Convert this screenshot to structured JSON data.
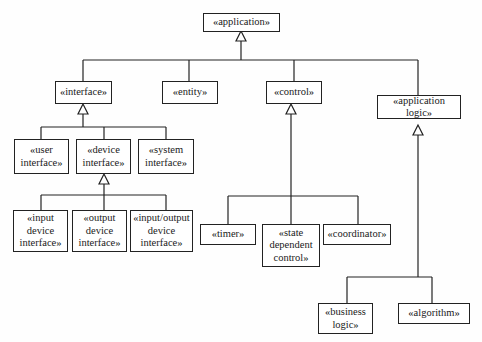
{
  "diagram": {
    "type": "UML stereotype generalization hierarchy",
    "root": {
      "id": "application",
      "label": "«application»"
    },
    "nodes": [
      {
        "id": "application",
        "label": "«application»",
        "parent": null
      },
      {
        "id": "interface",
        "label": "«interface»",
        "parent": "application"
      },
      {
        "id": "entity",
        "label": "«entity»",
        "parent": "application"
      },
      {
        "id": "control",
        "label": "«control»",
        "parent": "application"
      },
      {
        "id": "application_logic",
        "label": "«application logic»",
        "parent": "application"
      },
      {
        "id": "user_interface",
        "label": "«user\ninterface»",
        "parent": "interface"
      },
      {
        "id": "device_interface",
        "label": "«device\ninterface»",
        "parent": "interface"
      },
      {
        "id": "system_interface",
        "label": "«system\ninterface»",
        "parent": "interface"
      },
      {
        "id": "input_device_interface",
        "label": "«input\ndevice\ninterface»",
        "parent": "device_interface"
      },
      {
        "id": "output_device_interface",
        "label": "«output\ndevice\ninterface»",
        "parent": "device_interface"
      },
      {
        "id": "input_output_device_interface",
        "label": "«input/output\ndevice\ninterface»",
        "parent": "device_interface"
      },
      {
        "id": "timer",
        "label": "«timer»",
        "parent": "control"
      },
      {
        "id": "state_dependent_control",
        "label": "«state\ndependent\ncontrol»",
        "parent": "control"
      },
      {
        "id": "coordinator",
        "label": "«coordinator»",
        "parent": "control"
      },
      {
        "id": "business_logic",
        "label": "«business\nlogic»",
        "parent": "application_logic"
      },
      {
        "id": "algorithm",
        "label": "«algorithm»",
        "parent": "application_logic"
      }
    ],
    "edge_style": "generalization (hollow triangle arrowhead at parent)"
  },
  "labels": {
    "application": "«application»",
    "interface": "«interface»",
    "entity": "«entity»",
    "control": "«control»",
    "application_logic": "«application logic»",
    "user_interface": "«user\ninterface»",
    "device_interface": "«device\ninterface»",
    "system_interface": "«system\ninterface»",
    "input_device_interface": "«input\ndevice\ninterface»",
    "output_device_interface": "«output\ndevice\ninterface»",
    "input_output_device_interface": "«input/output\ndevice\ninterface»",
    "timer": "«timer»",
    "state_dependent_control": "«state\ndependent\ncontrol»",
    "coordinator": "«coordinator»",
    "business_logic": "«business\nlogic»",
    "algorithm": "«algorithm»"
  },
  "colors": {
    "line": "#222222",
    "background": "#fefefe",
    "text": "#1a1a1a"
  }
}
